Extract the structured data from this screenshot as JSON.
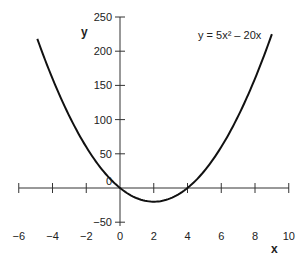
{
  "chart_data": {
    "type": "line",
    "title": "",
    "equation_label": "y = 5x² – 20x",
    "xlabel": "x",
    "ylabel": "y",
    "xlim": [
      -6,
      10
    ],
    "ylim": [
      -50,
      250
    ],
    "x_ticks": [
      -6,
      -4,
      -2,
      0,
      2,
      4,
      6,
      8,
      10
    ],
    "y_ticks": [
      -50,
      0,
      50,
      100,
      150,
      200,
      250
    ],
    "x_tick_labels": [
      "−6",
      "−4",
      "−2",
      "0",
      "2",
      "4",
      "6",
      "8",
      "10"
    ],
    "y_tick_labels": [
      "−50",
      "0",
      "50",
      "100",
      "150",
      "200",
      "250"
    ],
    "grid": false,
    "legend": null,
    "series": [
      {
        "name": "y = 5x² – 20x",
        "function": "5*x^2 - 20*x",
        "x_range": [
          -4.9,
          9
        ],
        "x": [
          -4.9,
          -4,
          -2,
          0,
          2,
          4,
          6,
          8,
          9
        ],
        "y": [
          218.05,
          160,
          60,
          0,
          -20,
          0,
          60,
          160,
          225
        ]
      }
    ],
    "annotations": [
      {
        "text": "y = 5x² – 20x",
        "position": "upper right"
      }
    ]
  },
  "colors": {
    "curve": "#111111",
    "axis": "#333333",
    "text": "#222222"
  }
}
